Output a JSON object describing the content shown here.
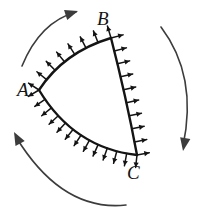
{
  "figure": {
    "kind": "geometry-diagram",
    "width": 213,
    "height": 216,
    "background_color": "#ffffff",
    "ink_color": "#141414",
    "arc_color": "#3c3c3c"
  },
  "vertices": [
    {
      "id": "A",
      "label": "A",
      "x": 39,
      "y": 90,
      "label_x": 17,
      "label_y": 80
    },
    {
      "id": "B",
      "label": "B",
      "x": 111,
      "y": 38,
      "label_x": 97,
      "label_y": 9
    },
    {
      "id": "C",
      "label": "C",
      "x": 137,
      "y": 155,
      "label_x": 127,
      "label_y": 163
    }
  ],
  "edges": [
    {
      "id": "AB",
      "from": "A",
      "to": "B",
      "curve": "arc-bulging-up-left",
      "path": "M 39 90 Q 64 52 111 38",
      "arrow_count": 8,
      "arrow_direction": "outward-normal"
    },
    {
      "id": "BC",
      "from": "B",
      "to": "C",
      "curve": "arc-bulging-left",
      "path": "M 111 38 Q 126 96 137 155",
      "arrow_count": 10,
      "arrow_direction": "outward-normal"
    },
    {
      "id": "AC",
      "from": "A",
      "to": "C",
      "curve": "arc-bulging-down",
      "path": "M 39 90 Q 74 148 137 155",
      "arrow_count": 13,
      "arrow_direction": "outward-normal"
    }
  ],
  "rotation_arcs": [
    {
      "id": "top-left-arc",
      "path": "M 22 66 Q 40 22 76 12",
      "arrow_at": "end",
      "arrow_x": 78,
      "arrow_y": 11,
      "arrow_angle": -18,
      "direction": "clockwise"
    },
    {
      "id": "right-arc",
      "path": "M 161 27 Q 198 76 183 146",
      "arrow_at": "end",
      "arrow_x": 183,
      "arrow_y": 151,
      "arrow_angle": 100,
      "direction": "clockwise"
    },
    {
      "id": "bottom-left-arc",
      "path": "M 126 205 Q 62 212 16 137",
      "arrow_at": "end",
      "arrow_x": 14,
      "arrow_y": 132,
      "arrow_angle": -118,
      "direction": "clockwise"
    }
  ]
}
